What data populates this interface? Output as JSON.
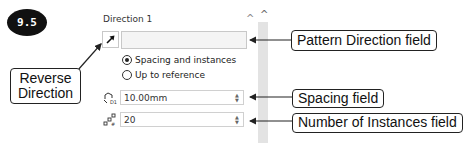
{
  "badge": {
    "label": "9.5"
  },
  "panel": {
    "section_title": "Direction 1",
    "collapse_icon": "chevron-up-icon",
    "scroll_icon": "chevron-up-icon",
    "reverse_direction_icon": "arrow-northeast-icon",
    "pattern_direction_value": "",
    "radio_options": [
      {
        "label": "Spacing and instances",
        "checked": true
      },
      {
        "label": "Up to reference",
        "checked": false
      }
    ],
    "spacing": {
      "icon": "spacing-icon",
      "value": "10.00mm"
    },
    "instances": {
      "icon": "instances-icon",
      "value": "20"
    }
  },
  "callouts": {
    "reverse_direction": "Reverse Direction",
    "reverse_line1": "Reverse",
    "reverse_line2": "Direction",
    "pattern_direction": "Pattern Direction field",
    "spacing": "Spacing field",
    "instances": "Number of Instances field"
  }
}
